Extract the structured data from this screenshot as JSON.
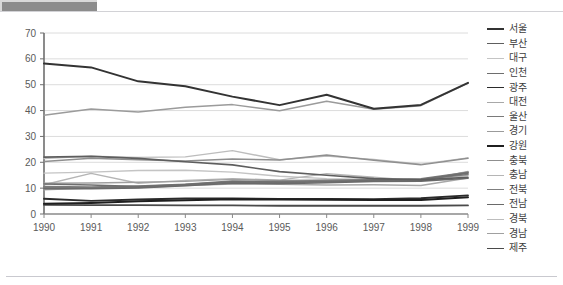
{
  "window": {
    "top_strip_color": "#8c8c8c"
  },
  "chart_data": {
    "type": "line",
    "title": "",
    "subtitle": "",
    "xlabel": "",
    "ylabel": "",
    "grid": true,
    "legend_position": "right",
    "xlim": [
      1990,
      1999
    ],
    "ylim": [
      0,
      70
    ],
    "yticks": [
      0,
      10,
      20,
      30,
      40,
      50,
      60,
      70
    ],
    "categories": [
      "1990",
      "1991",
      "1992",
      "1993",
      "1994",
      "1995",
      "1996",
      "1997",
      "1998",
      "1999"
    ],
    "x": [
      1990,
      1991,
      1992,
      1993,
      1994,
      1995,
      1996,
      1997,
      1998,
      1999
    ],
    "series": [
      {
        "name": "서울",
        "color": "#333333",
        "width": 2.0,
        "values": [
          58.2,
          56.7,
          51.3,
          49.4,
          45.4,
          42.1,
          46.1,
          40.7,
          42.2,
          50.7
        ]
      },
      {
        "name": "부산",
        "color": "#5e5e5e",
        "width": 1.6,
        "values": [
          22.0,
          22.3,
          21.5,
          20.2,
          19.0,
          16.4,
          15.0,
          13.7,
          13.2,
          14.2
        ]
      },
      {
        "name": "대구",
        "color": "#c4c4c4",
        "width": 1.4,
        "values": [
          15.8,
          16.2,
          16.8,
          16.9,
          16.2,
          14.6,
          13.7,
          13.3,
          12.9,
          14.9
        ]
      },
      {
        "name": "인천",
        "color": "#6e6e6e",
        "width": 1.6,
        "values": [
          11.6,
          11.2,
          10.6,
          11.4,
          12.5,
          12.3,
          12.5,
          13.0,
          13.3,
          15.8
        ]
      },
      {
        "name": "광주",
        "color": "#2b2b2b",
        "width": 1.8,
        "values": [
          5.9,
          5.1,
          5.6,
          6.0,
          6.0,
          5.8,
          5.8,
          5.7,
          6.1,
          7.2
        ]
      },
      {
        "name": "대전",
        "color": "#a8a8a8",
        "width": 1.4,
        "values": [
          9.4,
          10.0,
          10.2,
          11.0,
          11.6,
          11.5,
          11.2,
          11.3,
          11.0,
          13.9
        ]
      },
      {
        "name": "울산",
        "color": "#7a7a7a",
        "width": 1.6,
        "values": [
          10.6,
          10.4,
          10.8,
          11.5,
          12.7,
          12.6,
          12.9,
          13.2,
          13.6,
          16.1
        ]
      },
      {
        "name": "경기",
        "color": "#9b9b9b",
        "width": 1.5,
        "values": [
          38.2,
          40.6,
          39.4,
          41.3,
          42.3,
          39.9,
          43.6,
          40.5,
          41.9,
          50.6
        ]
      },
      {
        "name": "강원",
        "color": "#1f1f1f",
        "width": 2.0,
        "values": [
          4.0,
          4.3,
          4.9,
          5.3,
          5.7,
          5.6,
          5.5,
          5.4,
          5.4,
          6.5
        ]
      },
      {
        "name": "충북",
        "color": "#8f8f8f",
        "width": 1.5,
        "values": [
          20.3,
          21.6,
          21.0,
          20.5,
          21.3,
          20.9,
          22.8,
          20.8,
          19.0,
          21.6
        ]
      },
      {
        "name": "충남",
        "color": "#b5b5b5",
        "width": 1.4,
        "values": [
          11.3,
          15.7,
          11.9,
          13.0,
          13.7,
          13.1,
          15.6,
          14.2,
          12.8,
          16.5
        ]
      },
      {
        "name": "전북",
        "color": "#7f7f7f",
        "width": 1.6,
        "values": [
          10.2,
          10.1,
          10.4,
          11.2,
          12.3,
          12.0,
          12.6,
          13.1,
          13.4,
          15.3
        ]
      },
      {
        "name": "전남",
        "color": "#6a6a6a",
        "width": 1.6,
        "values": [
          9.8,
          9.8,
          10.1,
          10.9,
          11.9,
          11.7,
          12.1,
          12.6,
          12.7,
          13.8
        ]
      },
      {
        "name": "경북",
        "color": "#bdbdbd",
        "width": 1.4,
        "values": [
          21.4,
          22.4,
          21.9,
          22.1,
          24.5,
          21.0,
          22.4,
          21.1,
          19.3,
          21.7
        ]
      },
      {
        "name": "경남",
        "color": "#a0a0a0",
        "width": 1.4,
        "values": [
          11.9,
          12.0,
          12.3,
          12.6,
          13.4,
          13.0,
          13.2,
          13.5,
          13.1,
          16.3
        ]
      },
      {
        "name": "제주",
        "color": "#4a4a4a",
        "width": 1.8,
        "values": [
          3.5,
          3.4,
          3.4,
          3.3,
          3.3,
          3.2,
          3.2,
          3.2,
          3.2,
          3.3
        ]
      }
    ]
  }
}
